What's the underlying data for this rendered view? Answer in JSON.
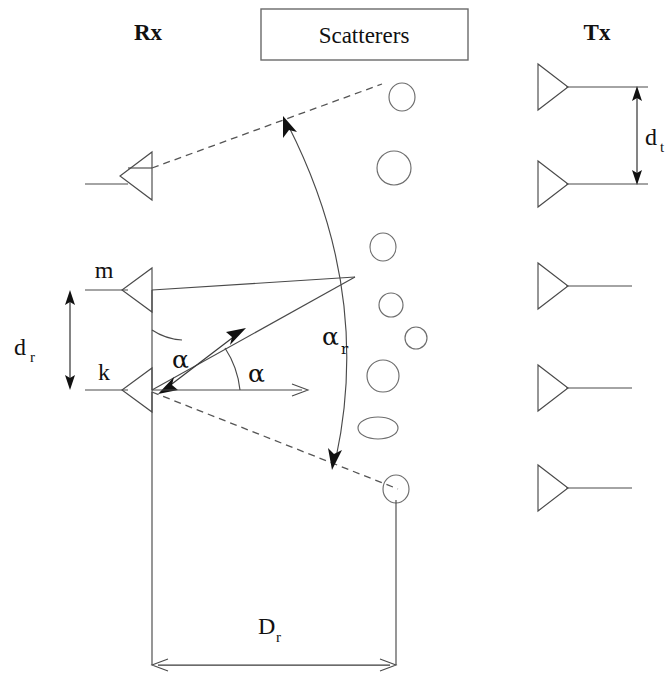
{
  "figure": {
    "title_left": "Rx",
    "title_right": "Tx",
    "scatterers_box_label": "Scatterers",
    "labels": {
      "antenna_m": "m",
      "antenna_k": "k",
      "rx_spacing": "d",
      "rx_spacing_sub": "r",
      "tx_spacing": "d",
      "tx_spacing_sub": "t",
      "rx_distance": "D",
      "rx_distance_sub": "r",
      "angle_alpha_left": "α",
      "angle_alpha_right": "α",
      "angle_spread": "α",
      "angle_spread_sub": "r"
    },
    "colors": {
      "line": "#4a4a4a",
      "dashed": "#555555",
      "scatterer": "#6d6d6d",
      "box": "#6a6a6a",
      "text": "#111111",
      "background": "#ffffff"
    },
    "geometry": {
      "rx_array_x": 152,
      "rx_antenna_top_y": 168,
      "rx_antenna_m_y": 290,
      "rx_antenna_k_y": 390,
      "tx_array_x": 560,
      "tx_antenna_ys": [
        86,
        183,
        286,
        388,
        488
      ],
      "scatter_point_x": 355,
      "scatter_point_y": 277,
      "arc_center_x": 152,
      "arc_center_y": 390,
      "dr_arrow_x": 70,
      "dr_arrow_top_y": 290,
      "dr_arrow_bottom_y": 390,
      "dt_arrow_x": 637,
      "dt_arrow_top_y": 88,
      "dt_arrow_bottom_y": 183,
      "Dr_arrow_y": 665,
      "Dr_arrow_left_x": 152,
      "Dr_arrow_right_x": 396
    },
    "scatterers": [
      {
        "cx": 402,
        "cy": 97,
        "rx": 13,
        "ry": 14
      },
      {
        "cx": 394,
        "cy": 168,
        "rx": 17,
        "ry": 17
      },
      {
        "cx": 383,
        "cy": 247,
        "rx": 13,
        "ry": 14
      },
      {
        "cx": 391,
        "cy": 305,
        "rx": 12,
        "ry": 12
      },
      {
        "cx": 416,
        "cy": 338,
        "rx": 11,
        "ry": 11
      },
      {
        "cx": 383,
        "cy": 376,
        "rx": 16,
        "ry": 16
      },
      {
        "cx": 378,
        "cy": 428,
        "rx": 20,
        "ry": 11
      },
      {
        "cx": 396,
        "cy": 489,
        "rx": 13,
        "ry": 14
      }
    ],
    "antenna_count_rx": 3,
    "antenna_count_tx": 5
  }
}
